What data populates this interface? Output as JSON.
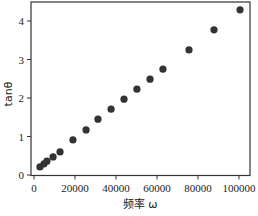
{
  "chart_data": {
    "type": "scatter",
    "title": "",
    "xlabel": "频率 ω",
    "ylabel": "tanθ",
    "xlim": [
      -1500,
      105000
    ],
    "ylim": [
      -0.05,
      4.5
    ],
    "xticks": [
      0,
      20000,
      40000,
      60000,
      80000,
      100000
    ],
    "yticks": [
      0,
      1,
      2,
      3,
      4
    ],
    "grid": false,
    "legend": null,
    "marker_color": "#333333",
    "series": [
      {
        "name": "tanθ vs ω",
        "x": [
          2900,
          4900,
          6300,
          9300,
          12700,
          19000,
          25400,
          31200,
          37600,
          43900,
          50200,
          56600,
          62900,
          75600,
          87800,
          100500
        ],
        "y": [
          0.21,
          0.29,
          0.36,
          0.47,
          0.6,
          0.91,
          1.17,
          1.45,
          1.71,
          1.97,
          2.23,
          2.49,
          2.75,
          3.25,
          3.77,
          4.29
        ]
      }
    ]
  }
}
